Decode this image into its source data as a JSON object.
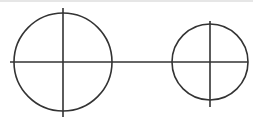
{
  "diagram": {
    "stroke_color": "#333333",
    "background": "#ffffff",
    "top_band_color": "#e6e6e6",
    "shaft": {
      "x1": 10,
      "y1": 62,
      "x2": 248,
      "y2": 62
    },
    "circles": [
      {
        "name": "left-circle",
        "cx": 63,
        "cy": 62,
        "r": 49,
        "crosshair_top": 8,
        "crosshair_bottom": 117
      },
      {
        "name": "right-circle",
        "cx": 210,
        "cy": 62,
        "r": 38,
        "crosshair_top": 21,
        "crosshair_bottom": 107
      }
    ]
  }
}
